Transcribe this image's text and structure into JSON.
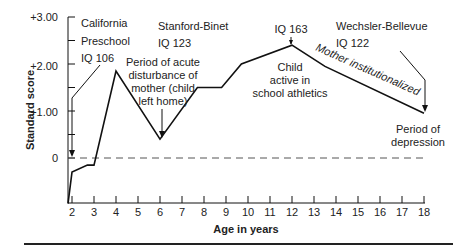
{
  "chart_data": {
    "type": "line",
    "title": "",
    "xlabel": "Age in years",
    "ylabel": "Standard score",
    "xlim": [
      1.8,
      18
    ],
    "ylim": [
      -1.0,
      3.0
    ],
    "x_ticks": [
      2,
      3,
      4,
      5,
      6,
      7,
      8,
      9,
      10,
      11,
      12,
      13,
      14,
      15,
      16,
      17,
      18
    ],
    "y_ticks": [
      {
        "value": 3.0,
        "label": "+3.00"
      },
      {
        "value": 2.5,
        "label": ""
      },
      {
        "value": 2.0,
        "label": "+2.00"
      },
      {
        "value": 1.5,
        "label": ""
      },
      {
        "value": 1.0,
        "label": "+1.00"
      },
      {
        "value": 0.5,
        "label": ""
      },
      {
        "value": 0,
        "label": "0"
      }
    ],
    "grid": false,
    "reference_line": {
      "y": 0,
      "style": "dashed"
    },
    "series": [
      {
        "name": "Standard score",
        "x": [
          1.8,
          2.0,
          2.7,
          3.0,
          4.0,
          6.0,
          7.7,
          8.8,
          9.7,
          12.0,
          13.5,
          18.0
        ],
        "y": [
          -0.97,
          -0.3,
          -0.15,
          -0.15,
          1.85,
          0.4,
          1.5,
          1.5,
          2.0,
          2.4,
          1.95,
          0.95
        ]
      }
    ],
    "annotations": [
      {
        "id": "california",
        "lines": [
          "California",
          "Preschool",
          "IQ 106"
        ],
        "points_to": {
          "x": 2,
          "y": 0
        }
      },
      {
        "id": "stanford",
        "lines": [
          "Stanford-Binet",
          "IQ 123"
        ]
      },
      {
        "id": "acute",
        "lines": [
          "Period of acute",
          "disturbance of",
          "mother (child",
          "left home)"
        ],
        "points_to": {
          "x": 6,
          "y": 0.4
        }
      },
      {
        "id": "iq163",
        "lines": [
          "IQ 163"
        ],
        "points_to": {
          "x": 12,
          "y": 2.4
        }
      },
      {
        "id": "athletics",
        "lines": [
          "Child",
          "active in",
          "school athletics"
        ]
      },
      {
        "id": "wechsler",
        "lines": [
          "Wechsler-Bellevue",
          "IQ 122"
        ],
        "points_to": {
          "x": 18,
          "y": 0.95
        }
      },
      {
        "id": "institutionalized",
        "lines": [
          "Mother institutionalized"
        ]
      },
      {
        "id": "depression",
        "lines": [
          "Period of",
          "depression"
        ]
      }
    ]
  },
  "labels": {
    "y_axis_title": "Standard score",
    "x_axis_title": "Age in years",
    "ytick_3": "+3.00",
    "ytick_2": "+2.00",
    "ytick_1": "+1.00",
    "ytick_0": "0",
    "xticks": [
      "2",
      "3",
      "4",
      "5",
      "6",
      "7",
      "8",
      "9",
      "10",
      "11",
      "12",
      "13",
      "14",
      "15",
      "16",
      "17",
      "18"
    ],
    "california": [
      "California",
      "Preschool",
      "IQ 106"
    ],
    "stanford": [
      "Stanford-Binet",
      "IQ 123"
    ],
    "acute": [
      "Period of acute",
      "disturbance of",
      "mother (child",
      "left home)"
    ],
    "iq163": "IQ 163",
    "athletics": [
      "Child",
      "active in",
      "school athletics"
    ],
    "wechsler": [
      "Wechsler-Bellevue",
      "IQ 122"
    ],
    "institutionalized": "Mother institutionalized",
    "depression": [
      "Period of",
      "depression"
    ]
  }
}
